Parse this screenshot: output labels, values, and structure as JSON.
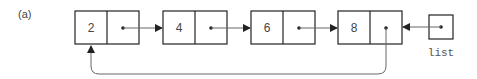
{
  "figure_label": "(a)",
  "nodes": [
    {
      "value": "2"
    },
    {
      "value": "4"
    },
    {
      "value": "6"
    },
    {
      "value": "8"
    }
  ],
  "head_pointer": {
    "label": "list"
  },
  "structure": "circular singly linked list; list points to last node (8), whose next points back to first node (2)",
  "colors": {
    "stroke": "#222222",
    "arrow": "#666666",
    "text": "#444444"
  }
}
